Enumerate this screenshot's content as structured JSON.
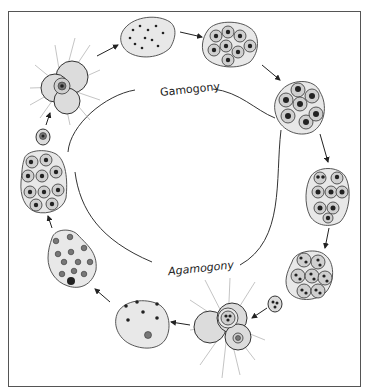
{
  "diagram": {
    "type": "life-cycle",
    "labels": {
      "upper_cycle": "Gamogony",
      "lower_cycle": "Agamogony"
    },
    "colors": {
      "line": "#222222",
      "cell_fill": "#dcdcdc",
      "background": "#ffffff",
      "frame": "#555555"
    },
    "stages": [
      {
        "id": "gamont-with-pseudopodia",
        "description": "multichambered cell with radiating pseudopodia, single nucleus",
        "position": "top-left"
      },
      {
        "id": "multinucleate-gamont",
        "description": "lobed cell with many small dark nuclei",
        "position": "top-center"
      },
      {
        "id": "gamete-clusters-1",
        "description": "cell cluster with many small nucleated cells",
        "position": "top-right"
      },
      {
        "id": "gamete-clusters-2",
        "description": "cluster of cells with large dark nuclei",
        "position": "right-upper"
      },
      {
        "id": "gamete-clusters-3",
        "description": "cluster of cells with dark nuclei",
        "position": "right-middle"
      },
      {
        "id": "zygote-cluster",
        "description": "compact cluster of many nucleated cells",
        "position": "right-lower"
      },
      {
        "id": "zygote",
        "description": "small cell with three nuclei",
        "position": "bottom-right"
      },
      {
        "id": "agamont-with-pseudopodia",
        "description": "multichambered cell with radiating pseudopodia",
        "position": "bottom-center"
      },
      {
        "id": "multinucleate-agamont",
        "description": "lobed cell with few dark nuclei",
        "position": "bottom-center-left"
      },
      {
        "id": "schizont",
        "description": "lobed cell with many grey nuclei and one dark nucleus",
        "position": "left-lower"
      },
      {
        "id": "embryo-cluster",
        "description": "clustered cells with nuclei",
        "position": "left-middle"
      },
      {
        "id": "young-cell",
        "description": "small cell with one nucleus",
        "position": "left-upper"
      }
    ]
  }
}
